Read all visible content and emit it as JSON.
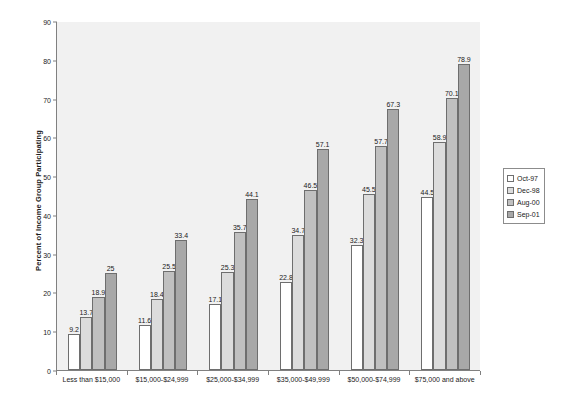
{
  "chart_data": {
    "type": "bar",
    "title": "",
    "subtitle": "",
    "xlabel": "",
    "ylabel": "Percent of Income Group Participating",
    "ylim": [
      0,
      90
    ],
    "ytick_step": 10,
    "yticks": [
      0,
      10,
      20,
      30,
      40,
      50,
      60,
      70,
      80,
      90
    ],
    "grid": false,
    "legend_position": "right",
    "categories": [
      "Less than $15,000",
      "$15,000-$24,999",
      "$25,000-$34,999",
      "$35,000-$49,999",
      "$50,000-$74,999",
      "$75,000 and above"
    ],
    "series": [
      {
        "name": "Oct-97",
        "color": "#ffffff",
        "values": [
          9.2,
          11.6,
          17.1,
          22.8,
          32.3,
          44.5
        ],
        "labels": [
          "9.2",
          "11.6",
          "17.1",
          "22.8",
          "32.3",
          "44.5"
        ]
      },
      {
        "name": "Dec-98",
        "color": "#dcdcdc",
        "values": [
          13.7,
          18.4,
          25.3,
          34.7,
          45.5,
          58.9
        ],
        "labels": [
          "13.7",
          "18.4",
          "25.3",
          "34.7",
          "45.5",
          "58.9"
        ]
      },
      {
        "name": "Aug-00",
        "color": "#c0c0c0",
        "values": [
          18.9,
          25.5,
          35.7,
          46.5,
          57.7,
          70.1
        ],
        "labels": [
          "18.9",
          "25.5",
          "35.7",
          "46.5",
          "57.7",
          "70.1"
        ]
      },
      {
        "name": "Sep-01",
        "color": "#a8a8a8",
        "values": [
          25,
          33.4,
          44.1,
          57.1,
          67.3,
          78.9
        ],
        "labels": [
          "25",
          "33.4",
          "44.1",
          "57.1",
          "67.3",
          "78.9"
        ]
      }
    ]
  },
  "legend": {
    "items": [
      {
        "label": "Oct-97"
      },
      {
        "label": "Dec-98"
      },
      {
        "label": "Aug-00"
      },
      {
        "label": "Sep-01"
      }
    ]
  }
}
